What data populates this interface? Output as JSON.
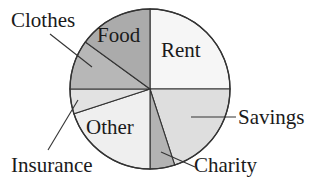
{
  "chart_data": {
    "type": "pie",
    "title": "",
    "start_angle_deg": 0,
    "direction": "clockwise",
    "slices": [
      {
        "label": "Rent",
        "value": 25,
        "color": "#f6f6f6",
        "label_position": "inside"
      },
      {
        "label": "Savings",
        "value": 20,
        "color": "#dedede",
        "label_position": "outside"
      },
      {
        "label": "Charity",
        "value": 5,
        "color": "#b3b3b3",
        "label_position": "outside"
      },
      {
        "label": "Other",
        "value": 20,
        "color": "#efefef",
        "label_position": "inside"
      },
      {
        "label": "Insurance",
        "value": 5,
        "color": "#e2e2e2",
        "label_position": "outside"
      },
      {
        "label": "Clothes",
        "value": 10,
        "color": "#b7b7b7",
        "label_position": "outside"
      },
      {
        "label": "Food",
        "value": 15,
        "color": "#ababab",
        "label_position": "inside"
      }
    ],
    "categories": [
      "Rent",
      "Savings",
      "Charity",
      "Other",
      "Insurance",
      "Clothes",
      "Food"
    ],
    "values": [
      25,
      20,
      5,
      20,
      5,
      10,
      15
    ],
    "legend": "none",
    "units": "percent"
  },
  "labels": {
    "rent": "Rent",
    "savings": "Savings",
    "charity": "Charity",
    "other": "Other",
    "insurance": "Insurance",
    "clothes": "Clothes",
    "food": "Food"
  },
  "colors": {
    "outline": "#333333",
    "text": "#1a1a1a",
    "background": "#ffffff"
  }
}
